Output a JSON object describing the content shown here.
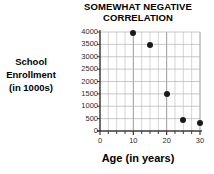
{
  "chart_data": {
    "type": "scatter",
    "title": "SOMEWHAT NEGATIVE CORRELATION",
    "title_lines": [
      "SOMEWHAT NEGATIVE",
      "CORRELATION"
    ],
    "xlabel": "Age (in years)",
    "ylabel": "School Enrollment (in 1000s)",
    "ylabel_lines": [
      "School",
      "Enrollment",
      "(in 1000s)"
    ],
    "xlim": [
      0,
      30
    ],
    "ylim": [
      0,
      4000
    ],
    "xticks": [
      0,
      10,
      20,
      30
    ],
    "xtick_labels": [
      "0",
      "10",
      "20",
      "30"
    ],
    "x_minor_tick_step": 2.5,
    "yticks": [
      0,
      500,
      1000,
      1500,
      2000,
      2500,
      3000,
      3500,
      4000
    ],
    "ytick_labels": [
      "0",
      "500",
      "1000",
      "1500",
      "2000",
      "2500",
      "3000",
      "3500",
      "4000"
    ],
    "grid": true,
    "grid_color": "#b9b9b9",
    "legend": false,
    "marker_color": "#1a1a1a",
    "points": [
      {
        "x": 10,
        "y": 3950
      },
      {
        "x": 15,
        "y": 3480
      },
      {
        "x": 20,
        "y": 1500
      },
      {
        "x": 25,
        "y": 460
      },
      {
        "x": 30,
        "y": 330
      }
    ]
  }
}
